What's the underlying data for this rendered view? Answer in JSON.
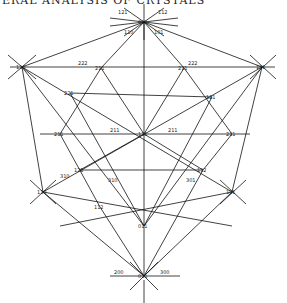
{
  "heading": "ERAL ANALYSIS OF CRYSTALS",
  "diagram": {
    "type": "stereographic-projection",
    "nodes": [
      {
        "id": "top",
        "label": "011",
        "x": 144,
        "y": 22
      },
      {
        "id": "upper-left",
        "label": "110",
        "x": 22,
        "y": 67
      },
      {
        "id": "upper-mid-left",
        "label": "211",
        "x": 101,
        "y": 68
      },
      {
        "id": "upper-mid-right",
        "label": "211",
        "x": 184,
        "y": 68
      },
      {
        "id": "upper-right",
        "label": "101",
        "x": 262,
        "y": 67
      },
      {
        "id": "left-inner",
        "label": "221",
        "x": 70,
        "y": 93
      },
      {
        "id": "right-inner",
        "label": "121",
        "x": 212,
        "y": 97
      },
      {
        "id": "mid-left",
        "label": "211",
        "x": 60,
        "y": 134
      },
      {
        "id": "center",
        "label": "111",
        "x": 144,
        "y": 134
      },
      {
        "id": "mid-right",
        "label": "211",
        "x": 232,
        "y": 134
      },
      {
        "id": "lower-left-inner",
        "label": "121",
        "x": 80,
        "y": 170
      },
      {
        "id": "lower-right-inner",
        "label": "112",
        "x": 203,
        "y": 170
      },
      {
        "id": "lower-left",
        "label": "110",
        "x": 43,
        "y": 192
      },
      {
        "id": "lower-right",
        "label": "101",
        "x": 232,
        "y": 192
      },
      {
        "id": "lower-mid-left",
        "label": "112",
        "x": 100,
        "y": 207
      },
      {
        "id": "lower-center",
        "label": "011",
        "x": 144,
        "y": 226
      },
      {
        "id": "bottom",
        "label": "011",
        "x": 144,
        "y": 276
      }
    ],
    "edge_labels": [
      "121",
      "112",
      "110",
      "101",
      "312",
      "130",
      "222",
      "321",
      "311",
      "211",
      "310",
      "301",
      "231",
      "213",
      "120",
      "102",
      "013",
      "031",
      "200",
      "300",
      "103",
      "321",
      "132",
      "231",
      "103",
      "010",
      "001"
    ],
    "axis_labels": {
      "left": "200",
      "right": "300"
    }
  }
}
